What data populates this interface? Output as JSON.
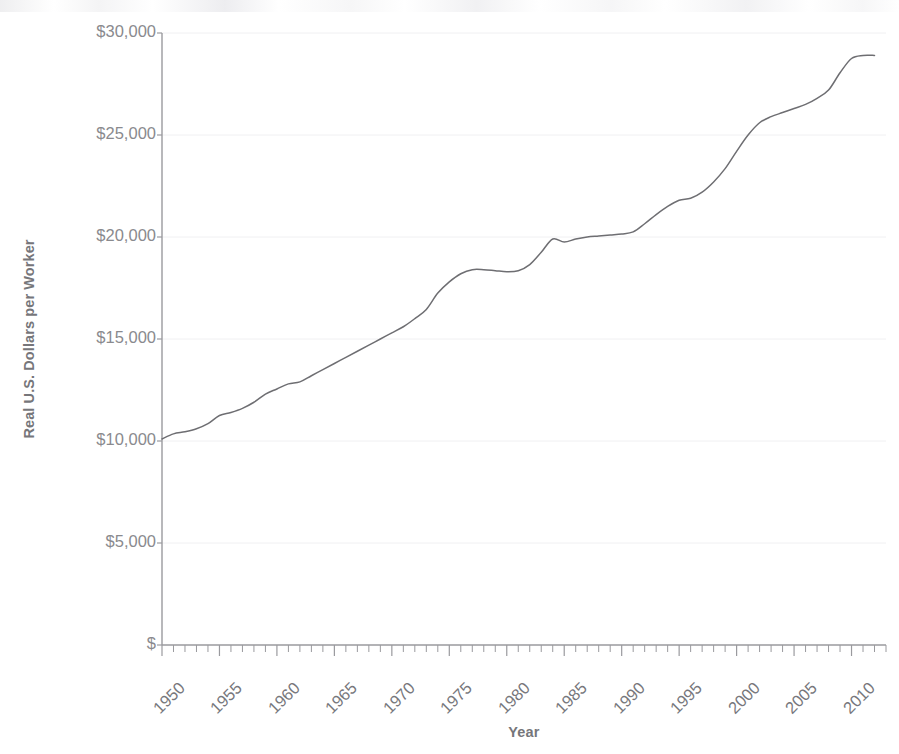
{
  "chart_data": {
    "type": "line",
    "title": "",
    "xlabel": "Year",
    "ylabel": "Real U.S. Dollars per Worker",
    "xlim": [
      1950,
      2013
    ],
    "ylim": [
      0,
      30000
    ],
    "grid": true,
    "grid_axis": "y",
    "legend": "none",
    "y_tick_labels": [
      "$30,000",
      "$25,000",
      "$20,000",
      "$15,000",
      "$10,000",
      "$5,000",
      "$"
    ],
    "y_tick_values": [
      30000,
      25000,
      20000,
      15000,
      10000,
      5000,
      0
    ],
    "x_tick_labels": [
      "1950",
      "1955",
      "1960",
      "1965",
      "1970",
      "1975",
      "1980",
      "1985",
      "1990",
      "1995",
      "2000",
      "2005",
      "2010"
    ],
    "x_tick_values": [
      1950,
      1955,
      1960,
      1965,
      1970,
      1975,
      1980,
      1985,
      1990,
      1995,
      2000,
      2005,
      2010
    ],
    "x_minor_tick_interval": 1,
    "series": [
      {
        "name": "Real U.S. Dollars per Worker",
        "color": "#6e6e72",
        "x": [
          1950,
          1951,
          1952,
          1953,
          1954,
          1955,
          1956,
          1957,
          1958,
          1959,
          1960,
          1961,
          1962,
          1963,
          1964,
          1965,
          1966,
          1967,
          1968,
          1969,
          1970,
          1971,
          1972,
          1973,
          1974,
          1975,
          1976,
          1977,
          1978,
          1979,
          1980,
          1981,
          1982,
          1983,
          1984,
          1985,
          1986,
          1987,
          1988,
          1989,
          1990,
          1991,
          1992,
          1993,
          1994,
          1995,
          1996,
          1997,
          1998,
          1999,
          2000,
          2001,
          2002,
          2003,
          2004,
          2005,
          2006,
          2007,
          2008,
          2009,
          2010,
          2011,
          2012
        ],
        "values": [
          10100,
          10350,
          10450,
          10600,
          10850,
          11250,
          11400,
          11600,
          11900,
          12300,
          12550,
          12800,
          12900,
          13200,
          13500,
          13800,
          14100,
          14400,
          14700,
          15000,
          15300,
          15600,
          16000,
          16450,
          17250,
          17800,
          18200,
          18400,
          18400,
          18350,
          18300,
          18350,
          18650,
          19250,
          19900,
          19750,
          19900,
          20000,
          20050,
          20100,
          20150,
          20250,
          20650,
          21100,
          21500,
          21800,
          21900,
          22200,
          22700,
          23350,
          24200,
          25000,
          25600,
          25900,
          26100,
          26300,
          26500,
          26800,
          27200,
          28050,
          28750,
          28900,
          28900
        ],
        "start_value": 10100,
        "end_value": 28900,
        "units": "Real U.S. Dollars per Worker"
      }
    ]
  },
  "axes": {
    "ylabel_text": "Real U.S. Dollars per Worker",
    "xlabel_text": "Year"
  },
  "colors": {
    "line": "#6e6e72",
    "axis": "#9a9a9e",
    "grid": "#f0f0f2",
    "tick_text": "#85858a",
    "title_text": "#76767a"
  }
}
